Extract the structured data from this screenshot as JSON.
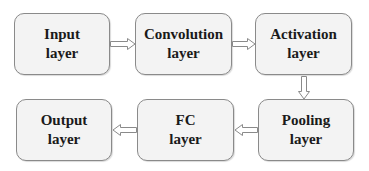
{
  "diagram": {
    "type": "flowchart",
    "title": "",
    "nodes": [
      {
        "id": "input",
        "line1": "Input",
        "line2": "layer"
      },
      {
        "id": "convolution",
        "line1": "Convolution",
        "line2": "layer"
      },
      {
        "id": "activation",
        "line1": "Activation",
        "line2": "layer"
      },
      {
        "id": "pooling",
        "line1": "Pooling",
        "line2": "layer"
      },
      {
        "id": "fc",
        "line1": "FC",
        "line2": "layer"
      },
      {
        "id": "output",
        "line1": "Output",
        "line2": "layer"
      }
    ],
    "edges": [
      {
        "from": "input",
        "to": "convolution",
        "direction": "right"
      },
      {
        "from": "convolution",
        "to": "activation",
        "direction": "right"
      },
      {
        "from": "activation",
        "to": "pooling",
        "direction": "down"
      },
      {
        "from": "pooling",
        "to": "fc",
        "direction": "left"
      },
      {
        "from": "fc",
        "to": "output",
        "direction": "left"
      }
    ],
    "colors": {
      "box_fill": "#f3f3f3",
      "box_border": "#8a8a8a",
      "text": "#1a1a1a",
      "arrow_stroke": "#8a8a8a",
      "arrow_fill": "#ffffff"
    }
  }
}
